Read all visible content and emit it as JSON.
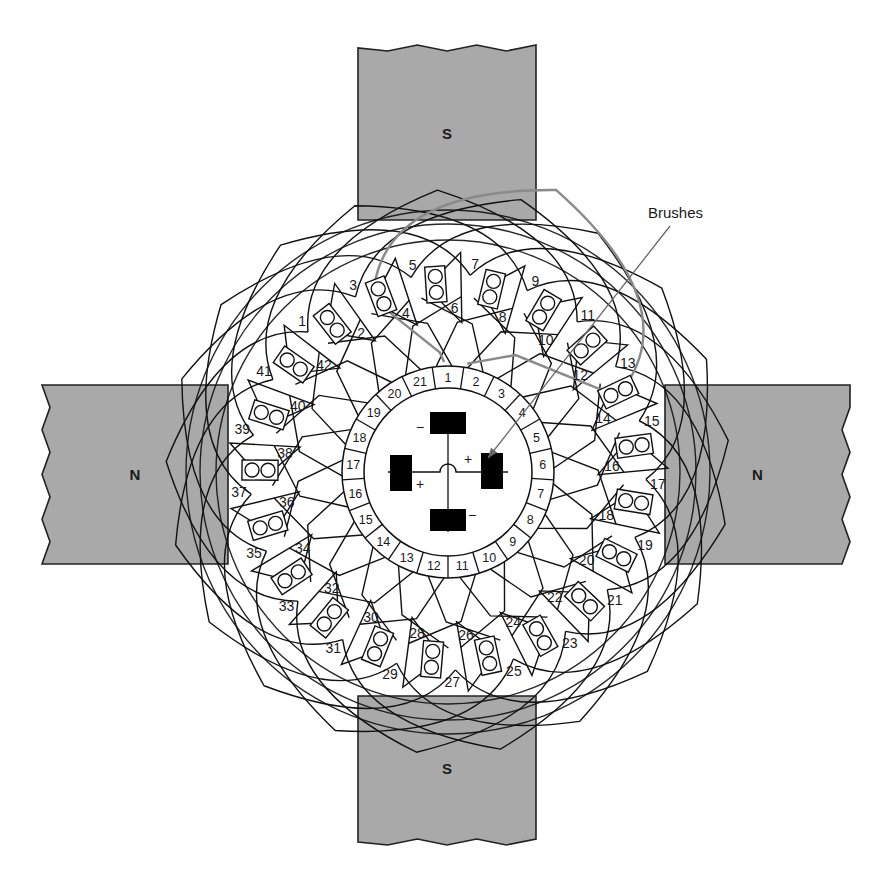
{
  "figure": {
    "title": "",
    "colors": {
      "pole_fill": "#a9a9a9",
      "line": "#111111",
      "highlight_coil": "#8a8a8a",
      "brush": "#000000",
      "background": "#ffffff"
    }
  },
  "poles": [
    {
      "id": "top",
      "label": "S",
      "x": 358,
      "y": 48,
      "w": 178,
      "h": 172
    },
    {
      "id": "bottom",
      "label": "S",
      "x": 358,
      "y": 696,
      "w": 178,
      "h": 146
    },
    {
      "id": "left",
      "label": "N",
      "x": 42,
      "y": 385,
      "w": 186,
      "h": 179
    },
    {
      "id": "right",
      "label": "N",
      "x": 665,
      "y": 385,
      "w": 185,
      "h": 179
    }
  ],
  "callout": {
    "label": "Brushes",
    "text_x": 648,
    "text_y": 218,
    "from": [
      670,
      226
    ],
    "to": [
      488,
      458
    ]
  },
  "commutator": {
    "cx": 448,
    "cy": 472,
    "r_inner": 84,
    "r_outer": 106,
    "segment_count": 21,
    "segments": [
      "1",
      "2",
      "3",
      "4",
      "5",
      "6",
      "7",
      "8",
      "9",
      "10",
      "11",
      "12",
      "13",
      "14",
      "15",
      "16",
      "17",
      "18",
      "19",
      "20",
      "21"
    ]
  },
  "brushes": [
    {
      "id": "top",
      "polarity": "−",
      "x": 430,
      "y": 412,
      "w": 36,
      "h": 22,
      "sign_x": 420,
      "sign_y": 432
    },
    {
      "id": "right",
      "polarity": "+",
      "x": 481,
      "y": 453,
      "w": 22,
      "h": 36,
      "sign_x": 468,
      "sign_y": 464
    },
    {
      "id": "bottom",
      "polarity": "−",
      "x": 430,
      "y": 509,
      "w": 36,
      "h": 22,
      "sign_x": 472,
      "sign_y": 520
    },
    {
      "id": "left",
      "polarity": "+",
      "x": 390,
      "y": 455,
      "w": 22,
      "h": 36,
      "sign_x": 420,
      "sign_y": 489
    }
  ],
  "slots": {
    "count": 21,
    "conductors_per_slot": 2,
    "items": [
      {
        "slot": 1,
        "outer": "1",
        "inner": "2"
      },
      {
        "slot": 2,
        "outer": "3",
        "inner": "4"
      },
      {
        "slot": 3,
        "outer": "5",
        "inner": "6"
      },
      {
        "slot": 4,
        "outer": "7",
        "inner": "8"
      },
      {
        "slot": 5,
        "outer": "9",
        "inner": "10"
      },
      {
        "slot": 6,
        "outer": "11",
        "inner": "12"
      },
      {
        "slot": 7,
        "outer": "13",
        "inner": "14"
      },
      {
        "slot": 8,
        "outer": "15",
        "inner": "16"
      },
      {
        "slot": 9,
        "outer": "17",
        "inner": "18"
      },
      {
        "slot": 10,
        "outer": "19",
        "inner": "20"
      },
      {
        "slot": 11,
        "outer": "21",
        "inner": "22"
      },
      {
        "slot": 12,
        "outer": "23",
        "inner": "24"
      },
      {
        "slot": 13,
        "outer": "25",
        "inner": "26"
      },
      {
        "slot": 14,
        "outer": "27",
        "inner": "28"
      },
      {
        "slot": 15,
        "outer": "29",
        "inner": "30"
      },
      {
        "slot": 16,
        "outer": "31",
        "inner": "32"
      },
      {
        "slot": 17,
        "outer": "33",
        "inner": "34"
      },
      {
        "slot": 18,
        "outer": "35",
        "inner": "36"
      },
      {
        "slot": 19,
        "outer": "37",
        "inner": "38"
      },
      {
        "slot": 20,
        "outer": "39",
        "inner": "40"
      },
      {
        "slot": 21,
        "outer": "41",
        "inner": "42"
      }
    ]
  }
}
